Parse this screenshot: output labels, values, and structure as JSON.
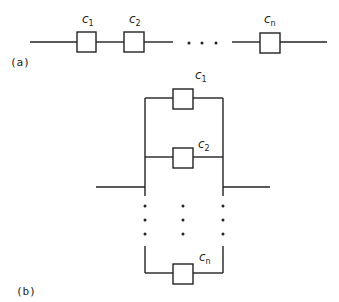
{
  "diagram": {
    "series": {
      "caption": "(a)",
      "components": [
        {
          "name": "c",
          "sub": "1"
        },
        {
          "name": "c",
          "sub": "2"
        },
        {
          "name": "c",
          "sub": "n"
        }
      ],
      "ellipsis": "• • •"
    },
    "parallel": {
      "caption": "(b)",
      "components": [
        {
          "name": "c",
          "sub": "1"
        },
        {
          "name": "c",
          "sub": "2"
        },
        {
          "name": "c",
          "sub": "n"
        }
      ]
    }
  }
}
